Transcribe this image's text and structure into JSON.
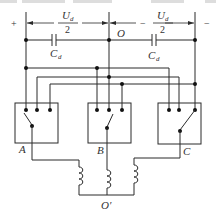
{
  "diagram": {
    "type": "three-level inverter / split DC bus circuit",
    "labels": {
      "plus": "+",
      "minus": "−",
      "half_voltage_left_num": "U",
      "half_voltage_left_sub": "d",
      "half_voltage_left_den": "2",
      "half_voltage_right_num": "U",
      "half_voltage_right_sub": "d",
      "half_voltage_right_den": "2",
      "midpoint": "O",
      "cap_left": "C",
      "cap_left_sub": "d",
      "cap_right": "C",
      "cap_right_sub": "d",
      "dash_mid_left": "−",
      "dash_mid_right": "−",
      "switch_a": "A",
      "switch_b": "B",
      "switch_c": "C",
      "neutral": "O′"
    },
    "nodes": [
      "+",
      "O",
      "−",
      "A",
      "B",
      "C",
      "O′"
    ],
    "components": {
      "capacitors": [
        "C_d (left)",
        "C_d (right)"
      ],
      "switch_boxes": [
        "A",
        "B",
        "C"
      ],
      "inductors": 3
    },
    "colors": {
      "line": "#2a2a2a",
      "text": "#333333",
      "background": "#ffffff"
    }
  }
}
